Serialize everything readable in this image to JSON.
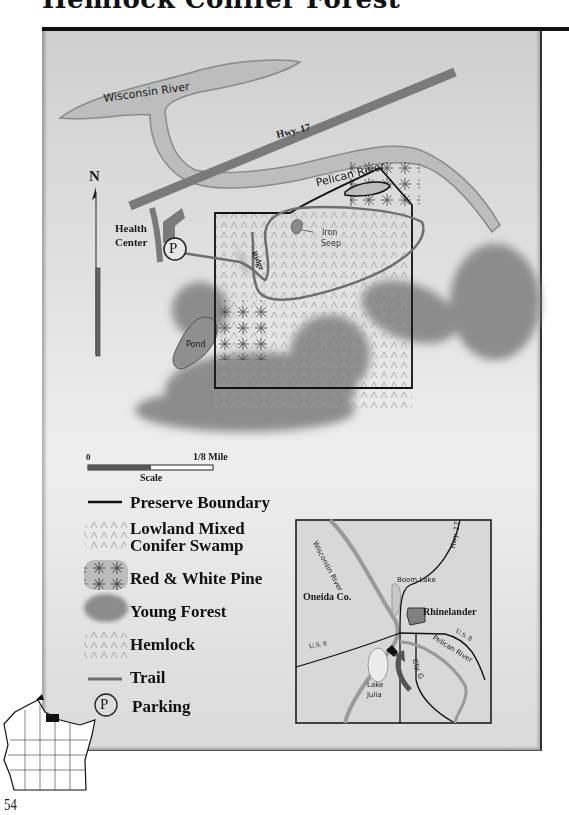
{
  "page": {
    "title": "Hemlock Conifer Forest",
    "page_number": "54"
  },
  "map": {
    "labels": {
      "wisconsin_river": "Wisconsin River",
      "hwy17": "Hwy. 17",
      "pelican_river": "Pelican River",
      "north": "N",
      "health_center_line1": "Health",
      "health_center_line2": "Center",
      "parking_symbol": "P",
      "iron_seep_line1": "Iron",
      "iron_seep_line2": "Seep",
      "ridge": "Ridge",
      "pond": "Pond"
    },
    "scale": {
      "start": "0",
      "end": "1/8 Mile",
      "label": "Scale"
    }
  },
  "legend": {
    "items": [
      {
        "label": "Preserve Boundary",
        "symbol": "black-line"
      },
      {
        "label_line1": "Lowland Mixed",
        "label_line2": "Conifer Swamp",
        "symbol": "lowland-swamp-pattern"
      },
      {
        "label": "Red & White Pine",
        "symbol": "pine-star-pattern"
      },
      {
        "label": "Young Forest",
        "symbol": "dark-gray-blob"
      },
      {
        "label": "Hemlock",
        "symbol": "hemlock-chevron-pattern"
      },
      {
        "label": "Trail",
        "symbol": "gray-line"
      },
      {
        "label": "Parking",
        "symbol": "circled-P"
      }
    ]
  },
  "inset_map": {
    "labels": {
      "wisconsin_river": "Wisconsin River",
      "hwy17": "Hwy. 17",
      "boom_lake": "Boom Lake",
      "oneida_co": "Oneida Co.",
      "rhinelander": "Rhinelander",
      "us8_left": "U.S. 8",
      "us8_right": "U.S. 8",
      "cty_g": "Cty. G",
      "pelican_river": "Pelican River",
      "lake_julia_line1": "Lake",
      "lake_julia_line2": "Julia"
    }
  },
  "colors": {
    "panel_bg": "#e2e2e2",
    "river": "#bdbdbd",
    "road": "#7a7a7a",
    "trail": "#6e6e6e",
    "young_forest": "#8c8c8c",
    "boundary": "#111111"
  }
}
